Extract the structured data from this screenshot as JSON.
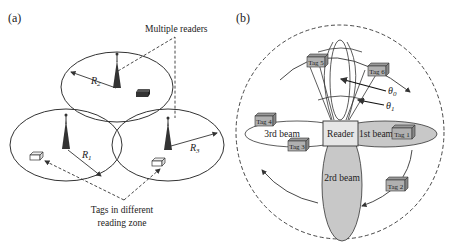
{
  "panel_a": {
    "label": "(a)",
    "callout_readers": "Multiple readers",
    "callout_tags_line1": "Tags in different",
    "callout_tags_line2": "reading zone",
    "radii": {
      "r1": "R",
      "r1_sub": "1",
      "r2": "R",
      "r2_sub": "2",
      "r3": "R",
      "r3_sub": "3"
    }
  },
  "panel_b": {
    "label": "(b)",
    "reader": "Reader",
    "beams": {
      "first": "1st beam",
      "second": "2rd beam",
      "third": "3rd beam"
    },
    "tags": [
      "Tag 1",
      "Tag 2",
      "Tag 3",
      "Tag 4",
      "Tag 5",
      "Tag 6"
    ],
    "angles": {
      "theta0": "θ",
      "theta0_sub": "0",
      "theta1": "θ",
      "theta1_sub": "1"
    }
  },
  "colors": {
    "line": "#333333",
    "beam_fill": "#c8c8c8",
    "tag_fill": "#b0b0b0",
    "reader_fill": "#e6e6e6",
    "antenna": "#333333"
  }
}
